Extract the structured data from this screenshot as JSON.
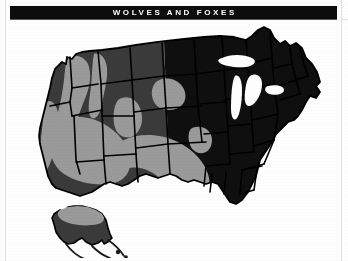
{
  "page": {
    "background_color": "#fefefe",
    "guide_color": "#e2e2e4"
  },
  "banner": {
    "title": "WOLVES AND FOXES",
    "background_color": "#0d0d0d",
    "text_color": "#ffffff"
  },
  "map": {
    "name": "united-states-range-map",
    "colors": {
      "east_fill": "#0f0f0f",
      "west_fill": "#3a3a3a",
      "range_overlay": "#9a9a9a",
      "border": "#000000",
      "water": "#ffffff"
    },
    "insets": [
      {
        "name": "alaska",
        "label": ""
      }
    ],
    "regions": [
      {
        "name": "western-states",
        "fill": "west_fill"
      },
      {
        "name": "eastern-states",
        "fill": "east_fill"
      },
      {
        "name": "range-overlay-northwest",
        "fill": "range_overlay"
      },
      {
        "name": "range-overlay-great-basin",
        "fill": "range_overlay"
      },
      {
        "name": "range-overlay-california",
        "fill": "range_overlay"
      },
      {
        "name": "range-overlay-southwest",
        "fill": "range_overlay"
      },
      {
        "name": "range-overlay-northern-plains",
        "fill": "range_overlay"
      },
      {
        "name": "range-overlay-alaska",
        "fill": "range_overlay"
      }
    ]
  }
}
